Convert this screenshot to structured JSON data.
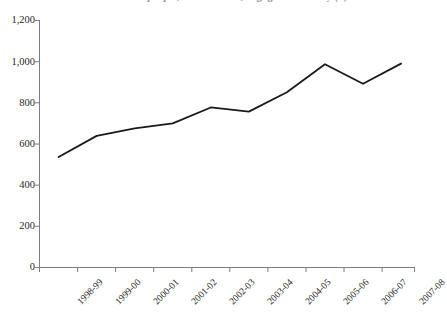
{
  "chart_data": {
    "type": "line",
    "title": "Number of people, in thousands, engaged in activity (a)",
    "subtitle": "",
    "xlabel": "",
    "ylabel": "",
    "categories": [
      "1998-99",
      "1999-00",
      "2000-01",
      "2001-02",
      "2002-03",
      "2003-04",
      "2004-05",
      "2005-06",
      "2006-07",
      "2007-08"
    ],
    "values": [
      534,
      637,
      673,
      698,
      775,
      755,
      849,
      985,
      890,
      988
    ],
    "series": [
      {
        "name": "Total",
        "values": [
          534,
          637,
          673,
          698,
          775,
          755,
          849,
          985,
          890,
          988
        ]
      }
    ],
    "ylim": [
      0,
      1200
    ],
    "y_ticks": [
      0,
      200,
      400,
      600,
      800,
      1000,
      1200
    ],
    "y_tick_labels": [
      "0",
      "200",
      "400",
      "600",
      "800",
      "1,000",
      "1,200"
    ],
    "grid": false,
    "legend": false,
    "legend_position": "none",
    "line_color": "#1a1a1a",
    "line_width": 1.8,
    "markers": false,
    "x_label_rotation": -45
  },
  "axes": {
    "y_axis_name": "y-axis",
    "x_axis_name": "x-axis"
  }
}
